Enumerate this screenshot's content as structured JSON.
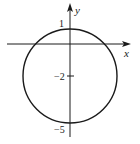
{
  "figure": {
    "type": "circle-on-axes",
    "colors": {
      "stroke": "#1a1a1a",
      "background": "#ffffff"
    },
    "axes": {
      "x_label": "x",
      "y_label": "y"
    },
    "labels": {
      "top": "1",
      "center": "−2",
      "bottom": "−5"
    },
    "circle": {
      "center": [
        0,
        -2
      ],
      "radius": 3,
      "top_y": 1,
      "bottom_y": -5
    }
  }
}
